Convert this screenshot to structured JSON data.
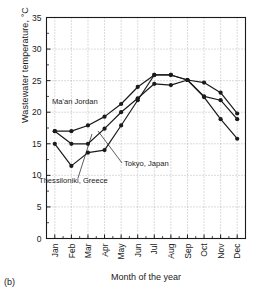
{
  "figure": {
    "caption": "(b)",
    "ylabel": "Wastewater temperature, °C",
    "xlabel": "Month of the year"
  },
  "chart_data": {
    "type": "line",
    "title": "",
    "xlabel": "Month of the year",
    "ylabel": "Wastewater temperature, °C",
    "categories": [
      "Jan",
      "Feb",
      "Mar",
      "Apr",
      "May",
      "Jun",
      "Jul",
      "Aug",
      "Sep",
      "Oct",
      "Nov",
      "Dec"
    ],
    "ylim": [
      0,
      35
    ],
    "yticks": [
      0,
      5,
      10,
      15,
      20,
      25,
      30,
      35
    ],
    "ytick_labels": [
      "0",
      "5",
      "10",
      "15",
      "20",
      "25",
      "30",
      "35"
    ],
    "grid": true,
    "grid_style": "dotted",
    "legend": "none",
    "marker": "filled-circle",
    "line_color": "#1a1a1a",
    "series": [
      {
        "name": "Ma'an Jordan",
        "values": [
          17.0,
          17.0,
          17.9,
          19.3,
          21.3,
          24.0,
          25.9,
          25.9,
          25.1,
          24.7,
          23.1,
          19.8
        ]
      },
      {
        "name": "Tokyo, Japan",
        "values": [
          17.0,
          15.0,
          15.0,
          17.4,
          20.0,
          22.2,
          24.5,
          24.3,
          25.1,
          22.5,
          21.9,
          18.9
        ]
      },
      {
        "name": "Thessiloniki, Greece",
        "values": [
          15.0,
          11.5,
          13.6,
          14.0,
          17.9,
          21.9,
          25.9,
          25.9,
          25.1,
          22.4,
          18.9,
          15.8
        ]
      }
    ],
    "annotations": [
      {
        "label": "Ma'an Jordan",
        "x": 52,
        "y": 104
      },
      {
        "label": "Tokyo, Japan",
        "x": 124,
        "y": 166
      },
      {
        "label": "Thessiloniki, Greece",
        "x": 39,
        "y": 183
      }
    ]
  }
}
